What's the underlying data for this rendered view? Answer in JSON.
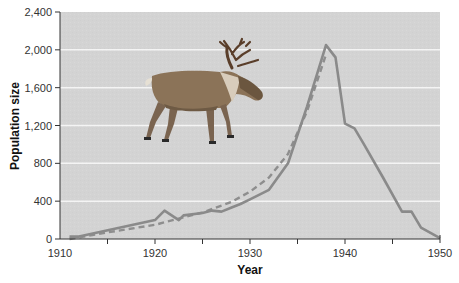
{
  "chart_data": {
    "type": "line",
    "title": "",
    "xlabel": "Year",
    "ylabel": "Population size",
    "xlim": [
      1910,
      1950
    ],
    "ylim": [
      0,
      2400
    ],
    "x_ticks": [
      1910,
      1920,
      1930,
      1940,
      1950
    ],
    "x_minor_ticks": [
      1915,
      1925,
      1935,
      1945
    ],
    "y_ticks": [
      0,
      400,
      800,
      1200,
      1600,
      2000,
      2400
    ],
    "y_tick_labels": [
      "0",
      "400",
      "800",
      "1,200",
      "1,600",
      "2,000",
      "2,400"
    ],
    "grid": "horizontal white lines",
    "legend": "none",
    "background_color": "#d4d4d4",
    "series": [
      {
        "name": "Observed population",
        "style": "solid",
        "color": "#8a8a8a",
        "x": [
          1911,
          1912,
          1920,
          1921,
          1922.5,
          1923,
          1925,
          1926,
          1927,
          1928,
          1929,
          1930,
          1932,
          1934,
          1936,
          1938,
          1939,
          1940,
          1941,
          1942,
          1944,
          1946,
          1947,
          1948,
          1950
        ],
        "values": [
          25,
          25,
          200,
          300,
          200,
          250,
          275,
          300,
          290,
          330,
          370,
          420,
          520,
          800,
          1400,
          2050,
          1920,
          1220,
          1170,
          1000,
          650,
          290,
          290,
          120,
          10
        ]
      },
      {
        "name": "Projected (exponential) growth",
        "style": "dashed",
        "color": "#8a8a8a",
        "x": [
          1911,
          1915,
          1920,
          1925,
          1928,
          1930,
          1932,
          1934,
          1936,
          1938
        ],
        "values": [
          0,
          70,
          150,
          280,
          390,
          500,
          650,
          900,
          1350,
          1950
        ]
      }
    ],
    "annotations": [
      {
        "type": "image",
        "description": "reindeer illustration",
        "position": "upper-left of plot area"
      }
    ]
  }
}
